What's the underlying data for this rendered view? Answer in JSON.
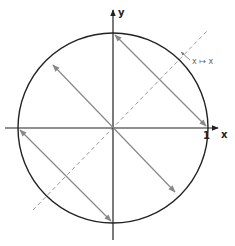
{
  "diagram": {
    "type": "unit-circle-reflection",
    "axes": {
      "x_label": "x",
      "y_label": "y",
      "tick_label": "1"
    },
    "annotation": {
      "text": "x ↦ x",
      "left": "x",
      "arrow": "↦",
      "right": "x"
    },
    "colors": {
      "circle": "#222222",
      "axes": "#222222",
      "arrows": "#888888",
      "dashed": "#999999"
    }
  }
}
